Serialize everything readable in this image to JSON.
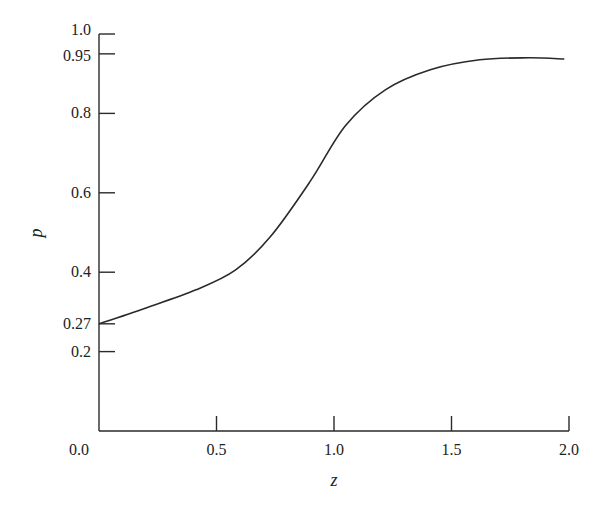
{
  "chart_data": {
    "type": "line",
    "title": "",
    "xlabel": "z",
    "ylabel": "p",
    "xlim": [
      0.0,
      2.0
    ],
    "ylim": [
      0.0,
      1.0
    ],
    "grid": false,
    "legend": null,
    "x_ticks": [
      {
        "value": 0.0,
        "label": "0.0"
      },
      {
        "value": 0.5,
        "label": "0.5"
      },
      {
        "value": 1.0,
        "label": "1.0"
      },
      {
        "value": 1.5,
        "label": "1.5"
      },
      {
        "value": 2.0,
        "label": "2.0"
      }
    ],
    "y_ticks": [
      {
        "value": 0.2,
        "label": "0.2"
      },
      {
        "value": 0.27,
        "label": "0.27"
      },
      {
        "value": 0.4,
        "label": "0.4"
      },
      {
        "value": 0.6,
        "label": "0.6"
      },
      {
        "value": 0.8,
        "label": "0.8"
      },
      {
        "value": 0.95,
        "label": "0.95"
      },
      {
        "value": 1.0,
        "label": "1.0"
      }
    ],
    "series": [
      {
        "name": "p(z)",
        "x": [
          0.0,
          0.2,
          0.41,
          0.58,
          0.73,
          0.9,
          1.05,
          1.22,
          1.41,
          1.62,
          1.83,
          1.98
        ],
        "y": [
          0.27,
          0.31,
          0.355,
          0.405,
          0.49,
          0.63,
          0.77,
          0.86,
          0.91,
          0.935,
          0.94,
          0.937
        ]
      }
    ]
  }
}
